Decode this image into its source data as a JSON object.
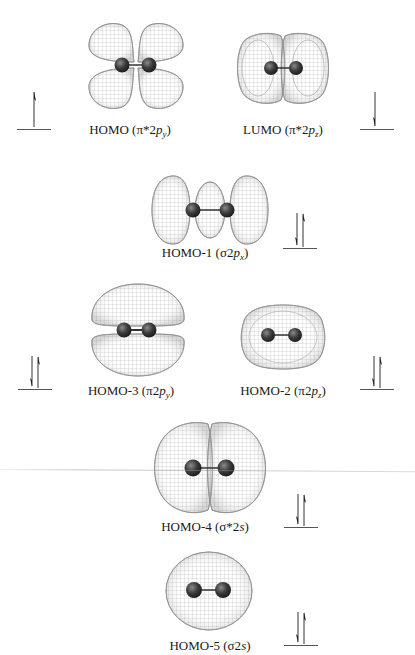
{
  "figure": {
    "type": "molecular-orbital-diagram",
    "wireframe_color": "#9a9a9a",
    "atom_color": "#3a3a3a",
    "orbitals": [
      {
        "id": "homo",
        "name": "HOMO",
        "symbol": "π*2",
        "sub": "y",
        "occupancy": "up",
        "electrons": 1
      },
      {
        "id": "lumo",
        "name": "LUMO",
        "symbol": "π*2",
        "sub": "z",
        "occupancy": "down",
        "electrons": 1
      },
      {
        "id": "homo1",
        "name": "HOMO-1",
        "symbol": "σ2",
        "sub": "x",
        "occupancy": "paired",
        "electrons": 2
      },
      {
        "id": "homo3",
        "name": "HOMO-3",
        "symbol": "π2",
        "sub": "y",
        "occupancy": "paired",
        "electrons": 2
      },
      {
        "id": "homo2",
        "name": "HOMO-2",
        "symbol": "π2",
        "sub": "z",
        "occupancy": "paired",
        "electrons": 2
      },
      {
        "id": "homo4",
        "name": "HOMO-4",
        "symbol": "σ*2",
        "sub_italic": "s",
        "occupancy": "paired",
        "electrons": 2
      },
      {
        "id": "homo5",
        "name": "HOMO-5",
        "symbol": "σ2",
        "sub_italic": "s",
        "occupancy": "paired",
        "electrons": 2
      }
    ]
  },
  "labels": {
    "homo": {
      "prefix": "HOMO (",
      "sym": "π*2",
      "p": "p",
      "sub": "y",
      "suffix": ")"
    },
    "lumo": {
      "prefix": "LUMO (",
      "sym": "π*2",
      "p": "p",
      "sub": "z",
      "suffix": ")"
    },
    "homo1": {
      "prefix": "HOMO-1 (",
      "sym": "σ2",
      "p": "p",
      "sub": "x",
      "suffix": ")"
    },
    "homo3": {
      "prefix": "HOMO-3 (",
      "sym": "π2",
      "p": "p",
      "sub": "y",
      "suffix": ")"
    },
    "homo2": {
      "prefix": "HOMO-2 (",
      "sym": "π2",
      "p": "p",
      "sub": "z",
      "suffix": ")"
    },
    "homo4": {
      "prefix": "HOMO-4 (",
      "sym": "σ*2",
      "s": "s",
      "suffix": ")"
    },
    "homo5": {
      "prefix": "HOMO-5 (",
      "sym": "σ2",
      "s": "s",
      "suffix": ")"
    }
  }
}
